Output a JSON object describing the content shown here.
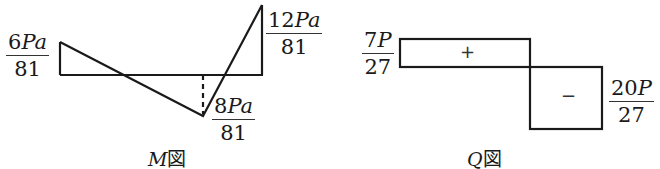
{
  "m_diagram": {
    "caption_var": "M",
    "caption_suffix": "図",
    "labels": {
      "left": {
        "num_coef": "6",
        "num_var": "Pa",
        "den": "81"
      },
      "right": {
        "num_coef": "12",
        "num_var": "Pa",
        "den": "81"
      },
      "bottom": {
        "num_coef": "8",
        "num_var": "Pa",
        "den": "81"
      }
    },
    "values": {
      "left": "6Pa/81",
      "min": "-8Pa/81",
      "right": "12Pa/81"
    }
  },
  "q_diagram": {
    "caption_var": "Q",
    "caption_suffix": "図",
    "labels": {
      "left": {
        "num_coef": "7",
        "num_var": "P",
        "den": "27"
      },
      "right": {
        "num_coef": "20",
        "num_var": "P",
        "den": "27"
      }
    },
    "signs": {
      "positive": "+",
      "negative": "−"
    },
    "values": {
      "positive": "7P/27",
      "negative": "-20P/27"
    }
  },
  "colors": {
    "stroke": "#1a1a1a",
    "background": "#ffffff"
  }
}
